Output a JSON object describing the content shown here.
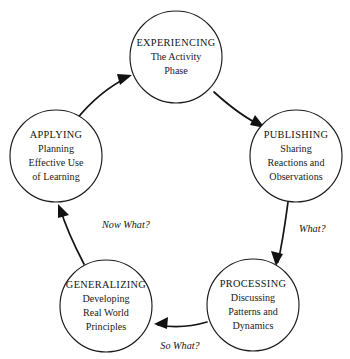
{
  "diagram": {
    "type": "cycle",
    "background_color": "#ffffff",
    "stroke_color": "#1c1c1c",
    "node_count": 5,
    "nodes": [
      {
        "id": "experiencing",
        "title": "EXPERIENCING",
        "lines": [
          "The Activity",
          "Phase"
        ],
        "cx": 176,
        "cy": 57,
        "r": 46
      },
      {
        "id": "publishing",
        "title": "PUBLISHING",
        "lines": [
          "Sharing",
          "Reactions and",
          "Observations"
        ],
        "cx": 296,
        "cy": 156,
        "r": 46
      },
      {
        "id": "processing",
        "title": "PROCESSING",
        "lines": [
          "Discussing",
          "Patterns and",
          "Dynamics"
        ],
        "cx": 253,
        "cy": 305,
        "r": 46
      },
      {
        "id": "generalizing",
        "title": "GENERALIZING",
        "lines": [
          "Developing",
          "Real World",
          "Principles"
        ],
        "cx": 106,
        "cy": 306,
        "r": 46
      },
      {
        "id": "applying",
        "title": "APPLYING",
        "lines": [
          "Planning",
          "Effective Use",
          "of Learning"
        ],
        "cx": 56,
        "cy": 156,
        "r": 46
      }
    ],
    "edges": [
      {
        "id": "experiencing-to-publishing",
        "from": "experiencing",
        "to": "publishing",
        "label": ""
      },
      {
        "id": "publishing-to-processing",
        "from": "publishing",
        "to": "processing",
        "label": "What?",
        "label_x": 299,
        "label_y": 232
      },
      {
        "id": "processing-to-generalizing",
        "from": "processing",
        "to": "generalizing",
        "label": "So What?",
        "label_x": 180,
        "label_y": 349
      },
      {
        "id": "generalizing-to-applying",
        "from": "generalizing",
        "to": "applying",
        "label": "Now What?",
        "label_x": 102,
        "label_y": 228
      },
      {
        "id": "applying-to-experiencing",
        "from": "applying",
        "to": "experiencing",
        "label": ""
      }
    ]
  }
}
